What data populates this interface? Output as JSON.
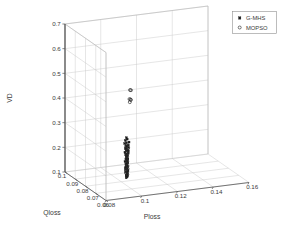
{
  "chart_data": {
    "type": "scatter",
    "title": "",
    "subtitle": "",
    "projection": "3d",
    "xlabel": "Qloss",
    "ylabel": "Ploss",
    "zlabel": "VD",
    "grid": true,
    "legend_position": "top-right",
    "xlim": [
      0.06,
      0.1
    ],
    "ylim": [
      0.08,
      0.16
    ],
    "zlim": [
      0.1,
      0.7
    ],
    "xticks": [
      0.1,
      0.09,
      0.08,
      0.07,
      0.06
    ],
    "yticks": [
      0.08,
      0.1,
      0.12,
      0.14,
      0.16
    ],
    "zticks": [
      0.1,
      0.2,
      0.3,
      0.4,
      0.5,
      0.6,
      0.7
    ],
    "xtick_labels": [
      "0.1",
      "0.09",
      "0.08",
      "0.07",
      "0.06"
    ],
    "ytick_labels": [
      "0.08",
      "0.1",
      "0.12",
      "0.14",
      "0.16"
    ],
    "ztick_labels": [
      "0.1",
      "0.2",
      "0.3",
      "0.4",
      "0.5",
      "0.6",
      "0.7"
    ],
    "series": [
      {
        "name": "G-MHS",
        "marker": "filled-square",
        "color": "#1a1a1a",
        "points": [
          [
            0.0823,
            0.1042,
            0.268
          ],
          [
            0.0826,
            0.1048,
            0.261
          ],
          [
            0.083,
            0.104,
            0.2555
          ],
          [
            0.082,
            0.1055,
            0.25
          ],
          [
            0.0828,
            0.1045,
            0.246
          ],
          [
            0.0833,
            0.1038,
            0.242
          ],
          [
            0.0818,
            0.105,
            0.2385
          ],
          [
            0.0825,
            0.1043,
            0.235
          ],
          [
            0.0831,
            0.1047,
            0.231
          ],
          [
            0.0822,
            0.1052,
            0.2275
          ],
          [
            0.0827,
            0.1041,
            0.224
          ],
          [
            0.0835,
            0.1046,
            0.2205
          ],
          [
            0.0819,
            0.1049,
            0.217
          ],
          [
            0.0829,
            0.1044,
            0.214
          ],
          [
            0.0824,
            0.1053,
            0.2105
          ],
          [
            0.0832,
            0.1039,
            0.207
          ],
          [
            0.0821,
            0.1051,
            0.204
          ],
          [
            0.0826,
            0.1045,
            0.2005
          ],
          [
            0.083,
            0.1042,
            0.1975
          ],
          [
            0.0823,
            0.1048,
            0.194
          ],
          [
            0.0828,
            0.1044,
            0.191
          ],
          [
            0.0834,
            0.105,
            0.188
          ],
          [
            0.0817,
            0.1046,
            0.1845
          ],
          [
            0.0825,
            0.1041,
            0.1815
          ],
          [
            0.0831,
            0.1054,
            0.1785
          ],
          [
            0.082,
            0.1043,
            0.1755
          ],
          [
            0.0827,
            0.1049,
            0.172
          ],
          [
            0.0833,
            0.104,
            0.169
          ],
          [
            0.0822,
            0.1047,
            0.166
          ],
          [
            0.0829,
            0.1052,
            0.163
          ],
          [
            0.0824,
            0.1044,
            0.16
          ],
          [
            0.0836,
            0.1048,
            0.157
          ],
          [
            0.0818,
            0.1042,
            0.154
          ],
          [
            0.0826,
            0.1051,
            0.1505
          ],
          [
            0.0832,
            0.1045,
            0.1475
          ],
          [
            0.0821,
            0.1039,
            0.1445
          ],
          [
            0.0828,
            0.105,
            0.1415
          ],
          [
            0.0835,
            0.1043,
            0.1385
          ],
          [
            0.0819,
            0.1047,
            0.1355
          ],
          [
            0.0827,
            0.1053,
            0.1325
          ],
          [
            0.083,
            0.1041,
            0.1295
          ],
          [
            0.0823,
            0.1046,
            0.1265
          ],
          [
            0.0833,
            0.1049,
            0.1235
          ],
          [
            0.082,
            0.1044,
            0.1205
          ],
          [
            0.0829,
            0.1051,
            0.1175
          ],
          [
            0.0825,
            0.1042,
            0.115
          ],
          [
            0.0834,
            0.1047,
            0.112
          ],
          [
            0.0822,
            0.1045,
            0.1095
          ],
          [
            0.0831,
            0.105,
            0.107
          ],
          [
            0.0826,
            0.1043,
            0.1045
          ]
        ]
      },
      {
        "name": "MOPSO",
        "marker": "open-circle",
        "color": "#2a2a2a",
        "points": [
          [
            0.0845,
            0.1075,
            0.452
          ],
          [
            0.0862,
            0.109,
            0.445
          ],
          [
            0.0838,
            0.1068,
            0.418
          ],
          [
            0.0849,
            0.108,
            0.412
          ],
          [
            0.0855,
            0.1085,
            0.408
          ],
          [
            0.0842,
            0.1072,
            0.404
          ],
          [
            0.083,
            0.105,
            0.238
          ],
          [
            0.0834,
            0.1046,
            0.23
          ],
          [
            0.0828,
            0.1055,
            0.224
          ],
          [
            0.0836,
            0.1048,
            0.218
          ],
          [
            0.0831,
            0.1052,
            0.212
          ],
          [
            0.0826,
            0.1044,
            0.206
          ],
          [
            0.0833,
            0.105,
            0.2
          ],
          [
            0.0829,
            0.1047,
            0.194
          ],
          [
            0.0835,
            0.1053,
            0.188
          ],
          [
            0.0827,
            0.1045,
            0.182
          ],
          [
            0.0832,
            0.1049,
            0.176
          ],
          [
            0.083,
            0.1051,
            0.17
          ],
          [
            0.0828,
            0.1046,
            0.164
          ],
          [
            0.0834,
            0.1048,
            0.158
          ],
          [
            0.0826,
            0.105,
            0.152
          ],
          [
            0.0831,
            0.1044,
            0.146
          ],
          [
            0.0829,
            0.1052,
            0.14
          ],
          [
            0.0833,
            0.1047,
            0.134
          ],
          [
            0.0827,
            0.1049,
            0.128
          ],
          [
            0.0832,
            0.1045,
            0.122
          ],
          [
            0.083,
            0.1051,
            0.116
          ],
          [
            0.0828,
            0.1048,
            0.11
          ]
        ]
      }
    ]
  },
  "legend": {
    "entries": [
      {
        "label": "G-MHS",
        "marker_name": "filled-square-marker"
      },
      {
        "label": "MOPSO",
        "marker_name": "open-circle-marker"
      }
    ]
  },
  "axes": {
    "z_title": "VD",
    "x_title": "Qloss",
    "y_title": "Ploss"
  }
}
